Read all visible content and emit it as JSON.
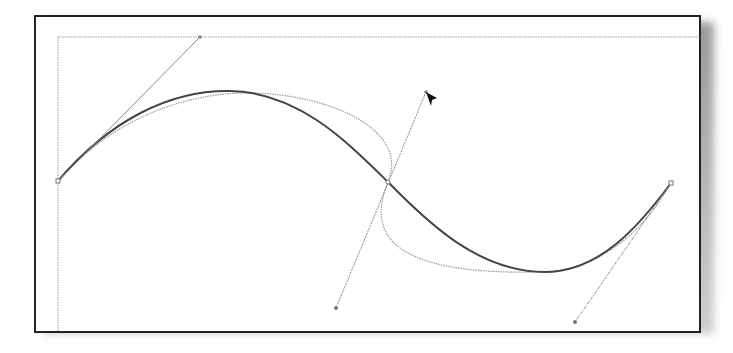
{
  "diagram": {
    "type": "bezier-curve-editing",
    "colors": {
      "frame_border": "#222222",
      "guide": "#9a9a9a",
      "main_curve": "#444444",
      "preview_curve": "#9a9a9a",
      "handle_line": "#8a8a8a",
      "cursor": "#111111"
    },
    "anchors": [
      {
        "name": "left-anchor",
        "x": 58,
        "y": 181
      },
      {
        "name": "middle-anchor",
        "x": 388,
        "y": 182
      },
      {
        "name": "right-anchor",
        "x": 671,
        "y": 183
      }
    ],
    "handles": [
      {
        "name": "left-handle",
        "from": [
          58,
          181
        ],
        "to": [
          200,
          37
        ]
      },
      {
        "name": "middle-handle-top",
        "from": [
          388,
          182
        ],
        "to": [
          426,
          92
        ]
      },
      {
        "name": "middle-handle-bottom",
        "from": [
          388,
          182
        ],
        "to": [
          336,
          308
        ]
      },
      {
        "name": "right-handle",
        "from": [
          671,
          183
        ],
        "to": [
          575,
          322
        ]
      }
    ],
    "cursor": {
      "x": 426,
      "y": 92
    }
  }
}
